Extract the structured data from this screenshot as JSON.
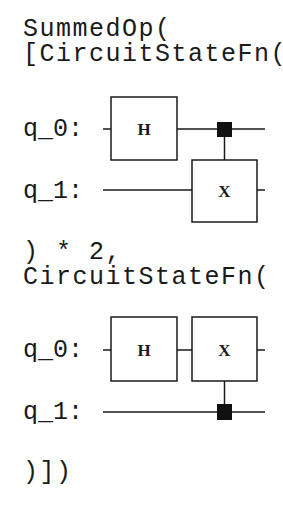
{
  "code": {
    "line1": "SummedOp(",
    "line2": "[CircuitStateFn(",
    "line3": ") * 2,",
    "line4": "CircuitStateFn(",
    "line5": ")])"
  },
  "circuit1": {
    "qubits": [
      "q_0:",
      "q_1:"
    ],
    "gates": [
      {
        "name": "H",
        "qubit": "q_0"
      },
      {
        "name": "X",
        "qubit": "q_1",
        "control": "q_0"
      }
    ],
    "gate_labels": {
      "h": "H",
      "x": "X"
    }
  },
  "circuit2": {
    "qubits": [
      "q_0:",
      "q_1:"
    ],
    "gates": [
      {
        "name": "H",
        "qubit": "q_0"
      },
      {
        "name": "X",
        "qubit": "q_0",
        "control": "q_1"
      }
    ],
    "gate_labels": {
      "h": "H",
      "x": "X"
    }
  },
  "colors": {
    "ink": "#1a1a1a",
    "background": "#ffffff"
  }
}
